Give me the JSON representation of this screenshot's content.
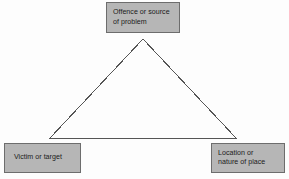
{
  "diagram": {
    "type": "triangle-relationship-diagram",
    "background_color": "#fdfdfd",
    "box_fill_color": "#b6b6b6",
    "box_border_color": "#6d6d6d",
    "line_color": "#555555",
    "text_color": "#1b1b1b",
    "nodes": [
      {
        "id": "offence",
        "position": "top",
        "lines": [
          "Offence or source",
          "of problem"
        ]
      },
      {
        "id": "victim",
        "position": "bottom-left",
        "lines": [
          "Victim or target"
        ]
      },
      {
        "id": "location",
        "position": "bottom-right",
        "lines": [
          "Location or",
          "nature of place"
        ]
      }
    ],
    "triangle": {
      "apex": [
        143,
        39
      ],
      "bottom_left": [
        50,
        138
      ],
      "bottom_right": [
        236,
        138
      ]
    }
  }
}
